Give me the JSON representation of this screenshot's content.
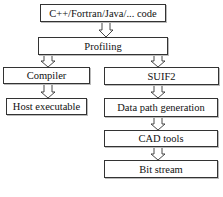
{
  "diagram": {
    "type": "flowchart",
    "nodes": [
      {
        "id": "source",
        "label": "C++/Fortran/Java/... code"
      },
      {
        "id": "profiling",
        "label": "Profiling"
      },
      {
        "id": "compiler",
        "label": "Compiler"
      },
      {
        "id": "suif2",
        "label": "SUIF2"
      },
      {
        "id": "host",
        "label": "Host executable"
      },
      {
        "id": "datapath",
        "label": "Data path generation"
      },
      {
        "id": "cad",
        "label": "CAD tools"
      },
      {
        "id": "bitstream",
        "label": "Bit stream"
      }
    ],
    "edges": [
      {
        "from": "source",
        "to": "profiling"
      },
      {
        "from": "profiling",
        "to": "compiler"
      },
      {
        "from": "profiling",
        "to": "suif2"
      },
      {
        "from": "compiler",
        "to": "host"
      },
      {
        "from": "suif2",
        "to": "datapath"
      },
      {
        "from": "datapath",
        "to": "cad"
      },
      {
        "from": "cad",
        "to": "bitstream"
      }
    ]
  }
}
